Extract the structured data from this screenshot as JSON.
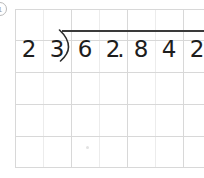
{
  "problem": {
    "number_label": "1",
    "divisor_digits": [
      "2",
      "3"
    ],
    "dividend_digits": [
      "6",
      "2",
      "8",
      "4",
      "2"
    ],
    "decimal_point": ".",
    "expression": "23)62.842",
    "quotient_digits": []
  },
  "grid": {
    "columns": 7,
    "rows": 5,
    "cell_width": 28,
    "cell_height": 31,
    "line_color": "#d8d8d8",
    "faint_line_color": "#ececec"
  },
  "colors": {
    "ink": "#1d1d1d",
    "rule": "#3a3a3a",
    "paper": "#ffffff"
  }
}
